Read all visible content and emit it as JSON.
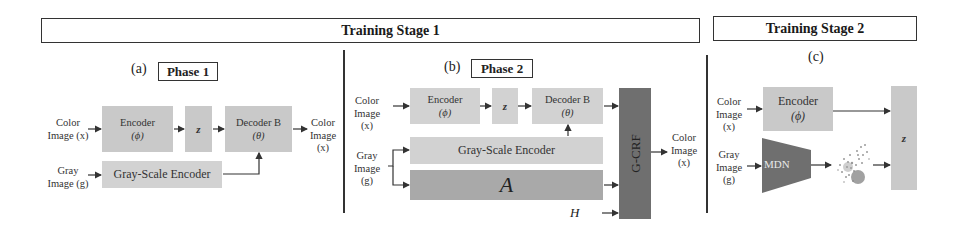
{
  "stages": {
    "stage1": {
      "label": "Training Stage 1"
    },
    "stage2": {
      "label": "Training Stage 2"
    }
  },
  "panel_a": {
    "letter": "(a)",
    "phase": "Phase 1",
    "input_color": {
      "line1": "Color",
      "line2": "Image (x)"
    },
    "input_gray": {
      "line1": "Gray",
      "line2": "Image (g)"
    },
    "encoder": {
      "line1": "Encoder",
      "line2": "(ϕ)"
    },
    "z": "z",
    "decoder": {
      "line1": "Decoder B",
      "line2": "(θ)"
    },
    "gray_encoder": "Gray-Scale Encoder",
    "output_color": {
      "line1": "Color",
      "line2": "Image",
      "line3": "(x)"
    }
  },
  "panel_b": {
    "letter": "(b)",
    "phase": "Phase 2",
    "input_color": {
      "line1": "Color",
      "line2": "Image",
      "line3": "(x)"
    },
    "input_gray": {
      "line1": "Gray",
      "line2": "Image",
      "line3": "(g)"
    },
    "encoder": {
      "line1": "Encoder",
      "line2": "(ϕ)"
    },
    "z": "z",
    "decoder": {
      "line1": "Decoder B",
      "line2": "(θ)"
    },
    "gray_encoder": "Gray-Scale Encoder",
    "a_block": "A",
    "h_input": "H",
    "gcrf": "G-CRF",
    "output_color": {
      "line1": "Color",
      "line2": "Image",
      "line3": "(x)"
    }
  },
  "panel_c": {
    "letter": "(c)",
    "input_color": {
      "line1": "Color",
      "line2": "Image",
      "line3": "(x)"
    },
    "input_gray": {
      "line1": "Gray",
      "line2": "Image",
      "line3": "(g)"
    },
    "encoder": {
      "line1": "Encoder",
      "line2": "(ϕ)"
    },
    "mdn": "MDN",
    "z": "z"
  },
  "colors": {
    "light_block": "#c9c9c9",
    "mid_block": "#a9a9a9",
    "dark_block": "#6f6f6f",
    "line": "#333333"
  }
}
